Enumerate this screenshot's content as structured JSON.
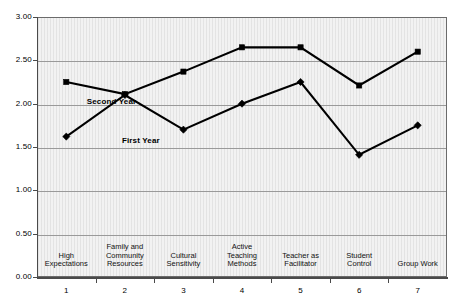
{
  "chart_data": {
    "type": "line",
    "title": "",
    "subtitle": "",
    "xlabel": "",
    "ylabel": "",
    "ylim": [
      0.0,
      3.0
    ],
    "y_ticks": [
      "0.00",
      "0.50",
      "1.00",
      "1.50",
      "2.00",
      "2.50",
      "3.00"
    ],
    "y_tick_values": [
      0.0,
      0.5,
      1.0,
      1.5,
      2.0,
      2.5,
      3.0
    ],
    "grid": true,
    "grid_axis": "y",
    "legend": "inline-labels",
    "x": [
      1,
      2,
      3,
      4,
      5,
      6,
      7
    ],
    "x_tick_labels": [
      "1",
      "2",
      "3",
      "4",
      "5",
      "6",
      "7"
    ],
    "categories": [
      "High Expectations",
      "Family and Community Resources",
      "Cultural Sensitivity",
      "Active Teaching Methods",
      "Teacher as Facilitator",
      "Student Control",
      "Group Work"
    ],
    "category_lines": [
      [
        "High",
        "Expectations"
      ],
      [
        "Family and",
        "Community",
        "Resources"
      ],
      [
        "Cultural",
        "Sensitivity"
      ],
      [
        "Active",
        "Teaching",
        "Methods"
      ],
      [
        "Teacher as",
        "Facilitator"
      ],
      [
        "Student",
        "Control"
      ],
      [
        "Group Work"
      ]
    ],
    "series": [
      {
        "name": "First Year",
        "marker": "diamond",
        "color": "#000000",
        "values": [
          1.62,
          2.1,
          1.7,
          2.0,
          2.25,
          1.41,
          1.75
        ]
      },
      {
        "name": "Second Year",
        "marker": "square",
        "color": "#000000",
        "values": [
          2.25,
          2.11,
          2.37,
          2.65,
          2.65,
          2.21,
          2.6
        ]
      }
    ],
    "annotations": [
      {
        "text": "Second Year",
        "x_value": 1.35,
        "y_value": 2.02
      },
      {
        "text": "First Year",
        "x_value": 1.95,
        "y_value": 1.57
      }
    ]
  },
  "colors": {
    "plot_background": "#f2f2f2",
    "page_background": "#ffffff",
    "gridline": "#9a9a9a",
    "axis": "#4a4a4a",
    "series": "#000000",
    "text": "#000000"
  }
}
